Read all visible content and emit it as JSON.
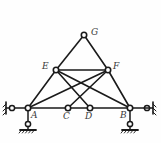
{
  "figure": {
    "background_color": "#fefefe",
    "line_color": "#1a1a1a",
    "label_color": "#3a3a3a",
    "node_fill": "#ffffff"
  },
  "nodes": [
    {
      "id": "A",
      "label": "A",
      "x": 28,
      "y": 108,
      "label_x": 31,
      "label_y": 111,
      "type": "support-joint"
    },
    {
      "id": "B",
      "label": "B",
      "x": 130,
      "y": 108,
      "label_x": 120,
      "label_y": 111,
      "type": "support-joint"
    },
    {
      "id": "C",
      "label": "C",
      "x": 68,
      "y": 108,
      "label_x": 63,
      "label_y": 112,
      "type": "chord-joint"
    },
    {
      "id": "D",
      "label": "D",
      "x": 90,
      "y": 108,
      "label_x": 85,
      "label_y": 112,
      "type": "chord-joint"
    },
    {
      "id": "E",
      "label": "E",
      "x": 56,
      "y": 70,
      "label_x": 42,
      "label_y": 62,
      "type": "upper-joint"
    },
    {
      "id": "F",
      "label": "F",
      "x": 108,
      "y": 70,
      "label_x": 113,
      "label_y": 62,
      "type": "upper-joint"
    },
    {
      "id": "G",
      "label": "G",
      "x": 84,
      "y": 35,
      "label_x": 91,
      "label_y": 28,
      "type": "apex-joint"
    }
  ],
  "members": [
    {
      "name": "member-A-B-bottom-chord",
      "from": "A",
      "to": "B"
    },
    {
      "name": "member-E-F-top-chord",
      "from": "E",
      "to": "F"
    },
    {
      "name": "member-E-G",
      "from": "E",
      "to": "G"
    },
    {
      "name": "member-F-G",
      "from": "F",
      "to": "G"
    },
    {
      "name": "member-A-E",
      "from": "A",
      "to": "E"
    },
    {
      "name": "member-B-F",
      "from": "B",
      "to": "F"
    },
    {
      "name": "member-A-F-diagonal",
      "from": "A",
      "to": "F"
    },
    {
      "name": "member-B-E-diagonal",
      "from": "B",
      "to": "E"
    },
    {
      "name": "member-E-D-diagonal",
      "from": "E",
      "to": "D"
    },
    {
      "name": "member-F-C-diagonal",
      "from": "F",
      "to": "C"
    }
  ],
  "supports": {
    "left": {
      "name": "support-A",
      "horizontal_link": {
        "pin_x": 12,
        "pin_y": 108,
        "wall_x": 6
      },
      "vertical_link": {
        "pin_x": 28,
        "pin_y": 124,
        "base_y": 130
      }
    },
    "right": {
      "name": "support-B",
      "horizontal_link": {
        "pin_x": 147,
        "pin_y": 108,
        "wall_x": 153
      },
      "vertical_link": {
        "pin_x": 130,
        "pin_y": 124,
        "base_y": 130
      }
    }
  }
}
